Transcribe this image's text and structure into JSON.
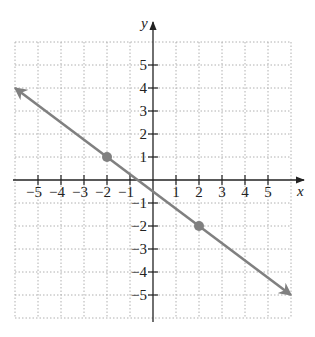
{
  "problem_label": "58.",
  "chart_data": {
    "type": "line",
    "title": "",
    "xlabel": "x",
    "ylabel": "y",
    "xlim": [
      -6,
      6
    ],
    "ylim": [
      -6,
      6
    ],
    "grid": true,
    "grid_style": "dotted",
    "x_ticks": [
      -5,
      -4,
      -3,
      -2,
      -1,
      1,
      2,
      3,
      4,
      5
    ],
    "y_ticks": [
      -5,
      -4,
      -3,
      -2,
      -1,
      1,
      2,
      3,
      4,
      5
    ],
    "x_tick_labels": [
      "−5",
      "−4",
      "−3",
      "−2",
      "−1",
      "1",
      "2",
      "3",
      "4",
      "5"
    ],
    "y_tick_labels": [
      "−5",
      "−4",
      "−3",
      "−2",
      "−1",
      "1",
      "2",
      "3",
      "4",
      "5"
    ],
    "series": [
      {
        "name": "line",
        "equation": "y = -3/4 x - 1/2",
        "x": [
          -6,
          6
        ],
        "y": [
          4,
          -5
        ],
        "arrows_both_ends": true,
        "color": "#808080"
      }
    ],
    "points": [
      {
        "x": -2,
        "y": 1,
        "color": "#808080"
      },
      {
        "x": 2,
        "y": -2,
        "color": "#808080"
      }
    ]
  },
  "colors": {
    "axis": "#222222",
    "grid": "#b0b0b0",
    "line": "#808080",
    "point": "#808080"
  }
}
